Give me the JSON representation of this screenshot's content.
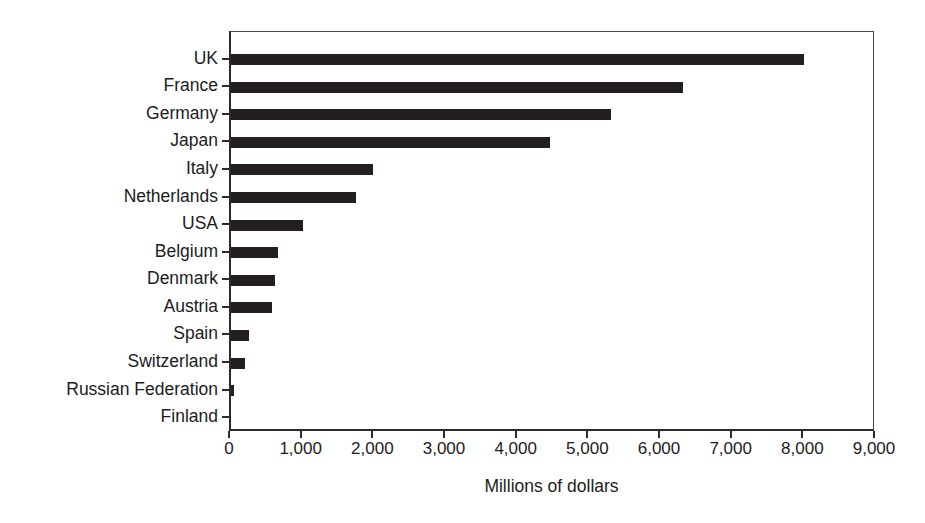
{
  "chart_data": {
    "type": "bar",
    "orientation": "horizontal",
    "title": "",
    "subtitle": "",
    "xlabel": "Millions of dollars",
    "ylabel": "",
    "xlim": [
      0,
      9000
    ],
    "xticks": [
      0,
      1000,
      2000,
      3000,
      4000,
      5000,
      6000,
      7000,
      8000,
      9000
    ],
    "xticklabels": [
      "0",
      "1,000",
      "2,000",
      "3,000",
      "4,000",
      "5,000",
      "6,000",
      "7,000",
      "8,000",
      "9,000"
    ],
    "grid": false,
    "legend": false,
    "legend_position": "none",
    "bar_color": "#231f20",
    "axis_color": "#2b2b2b",
    "background": "#ffffff",
    "categories": [
      "UK",
      "France",
      "Germany",
      "Japan",
      "Italy",
      "Netherlands",
      "USA",
      "Belgium",
      "Denmark",
      "Austria",
      "Spain",
      "Switzerland",
      "Russian Federation",
      "Finland"
    ],
    "values": [
      8000,
      6300,
      5300,
      4450,
      1980,
      1740,
      1000,
      650,
      620,
      570,
      250,
      200,
      40,
      0
    ],
    "annotations": []
  }
}
